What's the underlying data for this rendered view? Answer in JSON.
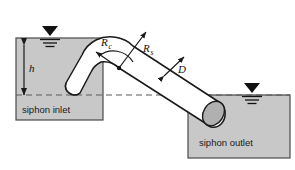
{
  "figure": {
    "type": "engineering-schematic",
    "subject": "siphon",
    "background_color": "#ffffff",
    "line_color": "#1a1a1a",
    "reservoir_fill": "#c8c8c8",
    "pipe_fill": "#ffffff",
    "pipe_end_fill": "#b0b0b0"
  },
  "reservoirs": [
    {
      "id": "inlet",
      "label": "siphon inlet",
      "x": 16,
      "y": 38,
      "width": 87,
      "height": 82,
      "label_x": 22,
      "label_y": 113,
      "water_level_y": 45
    },
    {
      "id": "outlet",
      "label": "siphon outlet",
      "x": 188,
      "y": 95,
      "width": 102,
      "height": 63,
      "label_x": 199,
      "label_y": 146,
      "water_level_y": 101
    }
  ],
  "water_markers": [
    {
      "id": "inlet-water-level",
      "x": 50,
      "y": 26
    },
    {
      "id": "outlet-water-level",
      "x": 252,
      "y": 83
    }
  ],
  "datum": {
    "id": "datum-line",
    "x1": 16,
    "x2": 290,
    "y": 95,
    "style": "dashed"
  },
  "dimensions": [
    {
      "id": "head-h",
      "label": "h",
      "subscript": "",
      "label_x": 29,
      "label_y": 72,
      "arrow_x": 24,
      "arrow_y1": 45,
      "arrow_y2": 95
    },
    {
      "id": "bend-radius",
      "label": "R",
      "subscript": "c",
      "label_x": 101,
      "label_y": 46,
      "from_x": 119,
      "from_y": 68,
      "to_x": 96,
      "to_y": 52
    },
    {
      "id": "siphon-radius",
      "label": "R",
      "subscript": "s",
      "label_x": 143,
      "label_y": 52,
      "from_x": 119,
      "from_y": 68,
      "to_x": 146,
      "to_y": 32
    },
    {
      "id": "pipe-diameter",
      "label": "D",
      "subscript": "",
      "label_x": 178,
      "label_y": 73,
      "from_x": 164,
      "from_y": 76,
      "to_x": 184,
      "to_y": 57
    }
  ],
  "bend_center": {
    "id": "bend-center-point",
    "x": 119,
    "y": 68,
    "r": 2.2
  }
}
